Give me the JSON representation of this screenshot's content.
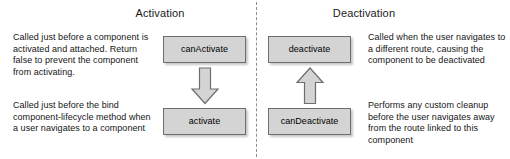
{
  "diagram": {
    "title_activation": "Activation",
    "title_deactivation": "Deactivation",
    "colors": {
      "node_fill": "#d4d4d4",
      "node_border": "#6e6e6e",
      "divider": "#8c8c8c",
      "text": "#000000",
      "background": "#ffffff"
    },
    "divider": "vertical-dashed-line"
  },
  "activation": {
    "title": "Activation",
    "descriptions": [
      "Called just before a component is activated and attached. Return false to prevent the component from activating.",
      "Called just before the bind component-lifecycle method when a user navigates to a component"
    ],
    "nodes": [
      {
        "label": "canActivate"
      },
      {
        "label": "activate"
      }
    ],
    "arrow": {
      "direction": "down",
      "icon": "arrow-down-icon"
    }
  },
  "deactivation": {
    "title": "Deactivation",
    "descriptions": [
      "Called when the user navigates to a different route, causing the component to be deactivated",
      "Performs any custom cleanup before the user navigates away from the route linked to this component"
    ],
    "nodes": [
      {
        "label": "deactivate"
      },
      {
        "label": "canDeactivate"
      }
    ],
    "arrow": {
      "direction": "up",
      "icon": "arrow-up-icon"
    }
  }
}
